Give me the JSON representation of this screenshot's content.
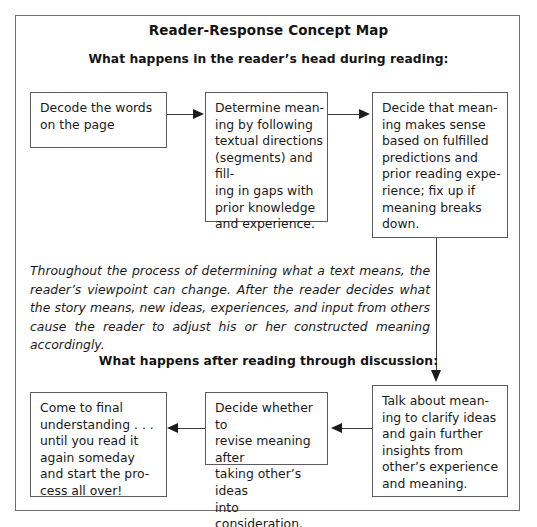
{
  "title": "Reader-Response Concept Map",
  "sections": {
    "heading_top": "What happens in the reader’s head during reading:",
    "heading_bottom": "What happens after reading through discussion:"
  },
  "nodes": {
    "decode": "Decode the words\non the page",
    "determine": "Determine mean-\ning by following\ntextual directions\n(segments) and fill-\ning in gaps with\nprior knowledge\nand experience.",
    "decide_sense": "Decide that mean-\ning makes sense\nbased on fulfilled\npredictions and\nprior reading expe-\nrience; fix up if\nmeaning breaks\ndown.",
    "talk": "Talk about mean-\ning to clarify ideas\nand gain further\ninsights from\nother’s experience\nand meaning.",
    "decide_revise": "Decide whether to\nrevise meaning after\ntaking other’s ideas\ninto consideration.",
    "come_final": "Come to final\nunderstanding . . .\nuntil you read it\nagain someday\nand start the pro-\ncess all over!"
  },
  "paragraph": "Throughout the process of determining what a text means, the reader’s viewpoint can change. After the reader decides what the story means, new ideas, experiences, and input from others cause the reader to adjust his or her constructed meaning accordingly.",
  "colors": {
    "frame_border": "#6f6f6f",
    "box_border": "#5c5c5c",
    "connector": "#3b3b3b",
    "text": "#1a1a1a",
    "background": "#ffffff"
  }
}
